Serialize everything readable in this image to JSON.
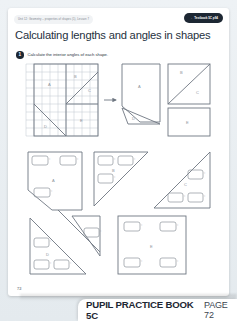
{
  "slide": {
    "breadcrumb": "Unit 12: Geometry – properties of shapes (1), Lesson 7",
    "badge_label": "Textbook 5C p94",
    "badge_arrow": "→",
    "title": "Calculating lengths and angles in shapes",
    "question_number": "1",
    "question_text": "Calculate the interior angles of each shape.",
    "page_number": "72",
    "footer": {
      "book": "PUPIL PRACTICE BOOK 5C",
      "page": "PAGE 72"
    },
    "colors": {
      "page_bg": "#ffffff",
      "slide_bg": "#e9eef1",
      "badge_bg": "#1d2733",
      "grid_line": "#b9c2cb",
      "shape_line": "#6e7681",
      "label_text": "#8d949b"
    }
  },
  "diagram": {
    "grid": {
      "cols": 9,
      "rows": 9,
      "region_labels": [
        "A",
        "B",
        "C",
        "D",
        "E"
      ],
      "arrow": "→"
    },
    "exploded_labels": [
      "A",
      "B",
      "C",
      "D",
      "E"
    ]
  },
  "answer_shapes": [
    {
      "label": "A",
      "type": "pentagon",
      "boxes": 3,
      "degree": "°"
    },
    {
      "label": "B",
      "type": "right-triangle",
      "boxes": 3,
      "degree": "°"
    },
    {
      "label": "C",
      "type": "right-triangle",
      "boxes": 3,
      "degree": "°"
    },
    {
      "label": "D",
      "type": "right-triangle",
      "boxes": 3,
      "degree": "°"
    },
    {
      "label": "E",
      "type": "square",
      "boxes": 4,
      "degree": "°"
    }
  ]
}
